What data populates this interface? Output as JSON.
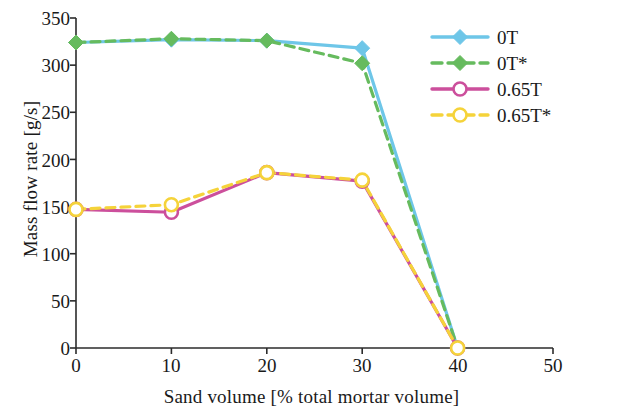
{
  "chart_data": {
    "type": "line",
    "title": "",
    "xlabel": "Sand volume [% total mortar volume]",
    "ylabel": "Mass flow rate [g/s]",
    "x": [
      0,
      10,
      20,
      30,
      40
    ],
    "xlim": [
      0,
      50
    ],
    "ylim": [
      0,
      350
    ],
    "xticks": [
      "0",
      "10",
      "20",
      "30",
      "40",
      "50"
    ],
    "yticks": [
      "0",
      "50",
      "100",
      "150",
      "200",
      "250",
      "300",
      "350"
    ],
    "grid": false,
    "legend_position": "top-right",
    "series": [
      {
        "name": "0T",
        "values": [
          324,
          327,
          326,
          318,
          0
        ],
        "color": "#6ec6e8",
        "style": "solid",
        "marker": "filled-diamond",
        "marker_color": "#6ec6e8"
      },
      {
        "name": "0T*",
        "values": [
          324,
          328,
          326,
          302,
          0
        ],
        "color": "#66bb5e",
        "style": "dashed",
        "marker": "filled-diamond",
        "marker_color": "#66bb5e"
      },
      {
        "name": "0.65T",
        "values": [
          147,
          144,
          186,
          177,
          0
        ],
        "color": "#cc4f9c",
        "style": "solid",
        "marker": "open-circle",
        "marker_color": "#cc4f9c"
      },
      {
        "name": "0.65T*",
        "values": [
          147,
          152,
          186,
          178,
          0
        ],
        "color": "#f5d33a",
        "style": "dashed",
        "marker": "open-circle",
        "marker_color": "#f5d33a"
      }
    ]
  },
  "axes": {
    "line_color": "#2b2b2b"
  }
}
